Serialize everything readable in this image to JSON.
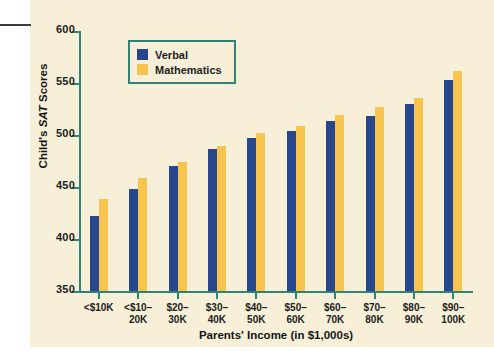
{
  "chart_data": {
    "type": "bar",
    "title": "",
    "xlabel": "Parents' Income (in $1,000s)",
    "ylabel": "Child's SAT Scores",
    "ylim": [
      350,
      600
    ],
    "yticks": [
      350,
      400,
      450,
      500,
      550,
      600
    ],
    "grid": false,
    "legend_position": "top-center",
    "categories": [
      "<$10K",
      "<$10–\n20K",
      "$20–\n30K",
      "$30–\n40K",
      "$40–\n50K",
      "$50–\n60K",
      "$60–\n70K",
      "$70–\n80K",
      "$80–\n90K",
      "$90–\n100K"
    ],
    "series": [
      {
        "name": "Verbal",
        "color": "#27468c",
        "values": [
          422,
          448,
          470,
          487,
          497,
          504,
          513,
          518,
          530,
          553
        ]
      },
      {
        "name": "Mathematics",
        "color": "#f6c44f",
        "values": [
          438,
          459,
          474,
          489,
          502,
          509,
          519,
          527,
          536,
          562
        ]
      }
    ]
  },
  "style": {
    "panel_background": "#f7efd7",
    "axis_color": "#2e8476",
    "text_color": "#1d1d1d",
    "rule_color": "#3c3c3c"
  },
  "ylabel_parts": {
    "before": "Child's ",
    "italic": "SAT",
    "after": " Scores"
  }
}
